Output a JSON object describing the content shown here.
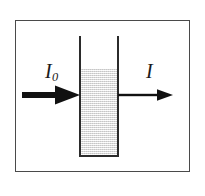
{
  "figure": {
    "name": "light-absorption-through-sample-cell",
    "background_color": "#ffffff",
    "frame": {
      "name": "figure-border",
      "stroke_color": "#4a4a4a",
      "stroke_width": 1.4
    },
    "cuvette": {
      "name": "sample-cell",
      "stroke_color": "#2b2b2b",
      "stroke_width": 2,
      "open_top": true,
      "fill_color": "#e4e4e4",
      "fill_texture": "dithered-speckle"
    },
    "arrows": {
      "incident": {
        "name": "incident-beam-arrow",
        "color": "#111111",
        "shaft_thickness": 6,
        "head_style": "large-solid-triangle",
        "direction": "right"
      },
      "transmitted": {
        "name": "transmitted-beam-arrow",
        "color": "#111111",
        "shaft_thickness": 2.4,
        "head_style": "small-solid-triangle",
        "direction": "right"
      }
    },
    "labels": {
      "incident_symbol": "I",
      "incident_subscript": "0",
      "transmitted_symbol": "I"
    }
  }
}
